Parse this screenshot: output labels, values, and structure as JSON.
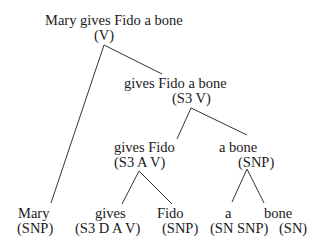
{
  "diagram": {
    "type": "parse-tree",
    "nodes": {
      "root": {
        "text": "Mary gives Fido a bone",
        "cat": "(V)"
      },
      "vp": {
        "text": "gives Fido a bone",
        "cat": "(S3 V)"
      },
      "gives_fido": {
        "text": "gives Fido",
        "cat": "(S3 A V)"
      },
      "a_bone": {
        "text": "a bone",
        "cat": "(SNP)"
      },
      "mary": {
        "text": "Mary",
        "cat": "(SNP)"
      },
      "gives": {
        "text": "gives",
        "cat": "(S3 D A V)"
      },
      "fido": {
        "text": "Fido",
        "cat": "(SNP)"
      },
      "a": {
        "text": "a",
        "cat": "(SN SNP)"
      },
      "bone": {
        "text": "bone",
        "cat": "(SN)"
      }
    },
    "edges": [
      [
        "root",
        "mary"
      ],
      [
        "root",
        "vp"
      ],
      [
        "vp",
        "gives_fido"
      ],
      [
        "vp",
        "a_bone"
      ],
      [
        "gives_fido",
        "gives"
      ],
      [
        "gives_fido",
        "fido"
      ],
      [
        "a_bone",
        "a"
      ],
      [
        "a_bone",
        "bone"
      ]
    ]
  }
}
